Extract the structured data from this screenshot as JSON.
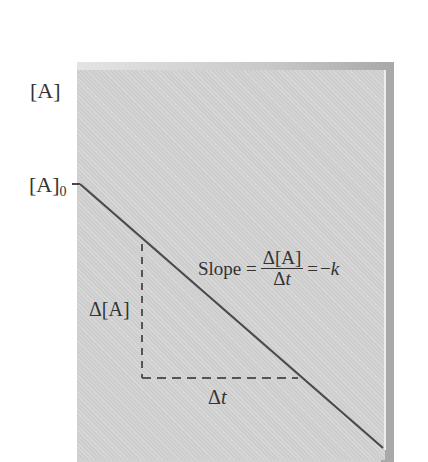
{
  "diagram": {
    "type": "zero-order kinetics plot",
    "y_axis_label": "[A]",
    "y_intercept_label": {
      "base": "[A]",
      "subscript": "0"
    },
    "line": {
      "description": "straight line with negative slope",
      "start": [
        80,
        184
      ],
      "end": [
        383,
        448
      ],
      "color": "#4a4a4a"
    },
    "slope_triangle": {
      "vertical_leg": {
        "x": 142,
        "y_top": 244,
        "y_bottom": 378
      },
      "horizontal_leg": {
        "y": 378,
        "x_left": 142,
        "x_right": 298
      },
      "vertical_label": "Δ[A]",
      "horizontal_label": {
        "delta": "Δ",
        "var": "t"
      }
    },
    "equation": {
      "lhs": "Slope =",
      "numerator": "Δ[A]",
      "denominator": {
        "delta": "Δ",
        "var": "t"
      },
      "rhs_eq": "=",
      "rhs_sign": "−",
      "rhs_var": "k"
    },
    "colors": {
      "panel_background": "#d4d4d4",
      "panel_border": "#a9a9a9",
      "line": "#4a4a4a",
      "text": "#333333"
    }
  }
}
